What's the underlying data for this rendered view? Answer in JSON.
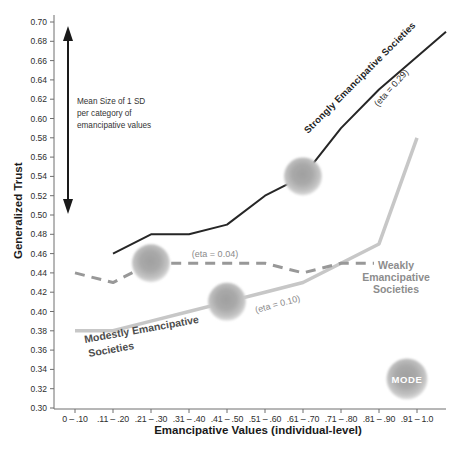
{
  "chart_data": {
    "type": "line",
    "title": "",
    "xlabel": "Emancipative Values (individual-level)",
    "ylabel": "Generalized Trust",
    "ylim": [
      0.3,
      0.7
    ],
    "y_tick_step": 0.02,
    "grid": false,
    "y_tick_labels": [
      "0.70",
      "0.68",
      "0.66",
      "0.64",
      "0.62",
      "0.60",
      "0.58",
      "0.56",
      "0.54",
      "0.52",
      "0.50",
      "0.48",
      "0.46",
      "0.44",
      "0.42",
      "0.40",
      "0.38",
      "0.36",
      "0.34",
      "0.32",
      "0.30"
    ],
    "categories": [
      "0 – .10",
      ".11 – .20",
      ".21 – .30",
      ".31 – .40",
      ".41 – .50",
      ".51 – .60",
      ".61 – .70",
      ".71 – .80",
      ".81 – .90",
      ".91 – 1.0"
    ],
    "series": [
      {
        "name": "Strongly Emancipative Societies",
        "label_lines": [
          "Strongly Emancipative Societies"
        ],
        "eta_label": "(eta = 0.29)",
        "color": "#262626",
        "style": "solid",
        "stroke_width": 2,
        "values": [
          null,
          0.46,
          0.48,
          0.48,
          0.49,
          0.52,
          0.54,
          0.59,
          0.63,
          0.69
        ],
        "mode_category_index": 6,
        "end_extends_to_axis": true
      },
      {
        "name": "Weakly Emancipative Societies",
        "label_lines": [
          "Weakly",
          "Emancipative",
          "Societies"
        ],
        "eta_label": "(eta = 0.04)",
        "color": "#989898",
        "style": "dashed",
        "stroke_width": 3,
        "values": [
          0.44,
          0.43,
          0.45,
          0.45,
          0.45,
          0.45,
          0.44,
          0.45,
          0.45,
          null
        ],
        "mode_category_index": 2,
        "end_extends_to_axis": false
      },
      {
        "name": "Modestly Emancipative Societies",
        "label_lines": [
          "Modestly Emancipative",
          "Societies"
        ],
        "eta_label": "(eta = 0.10)",
        "color": "#c7c7c7",
        "style": "solid",
        "stroke_width": 3.5,
        "values": [
          0.38,
          0.38,
          0.39,
          0.4,
          0.41,
          0.42,
          0.43,
          0.45,
          0.47,
          0.58
        ],
        "mode_category_index": 4,
        "end_extends_to_axis": false
      }
    ],
    "annotations": {
      "sd_arrow": {
        "label_lines": [
          "Mean Size of 1 SD",
          "per category of",
          "emancipative values"
        ],
        "from_value": 0.7,
        "to_value": 0.5
      },
      "mode_legend": {
        "label": "MODE"
      }
    },
    "legend_position": "none"
  }
}
